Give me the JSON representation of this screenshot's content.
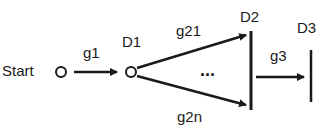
{
  "diagram": {
    "nodes": {
      "start": "Start",
      "d1": "D1",
      "d2": "D2",
      "d3": "D3"
    },
    "edges": {
      "g1": "g1",
      "g21": "g21",
      "g2n": "g2n",
      "g3": "g3",
      "ellipsis": "..."
    }
  }
}
